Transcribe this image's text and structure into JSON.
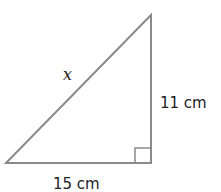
{
  "diagram": {
    "type": "right-triangle",
    "stroke_color": "#8a8a8a",
    "text_color": "#222222",
    "vertices": {
      "top": [
        151,
        15
      ],
      "right_angle": [
        151,
        163
      ],
      "bottom_left": [
        6,
        163
      ]
    },
    "labels": {
      "hypotenuse": "x",
      "vertical_leg": "11 cm",
      "horizontal_leg": "15 cm"
    },
    "right_angle_marker": true
  }
}
